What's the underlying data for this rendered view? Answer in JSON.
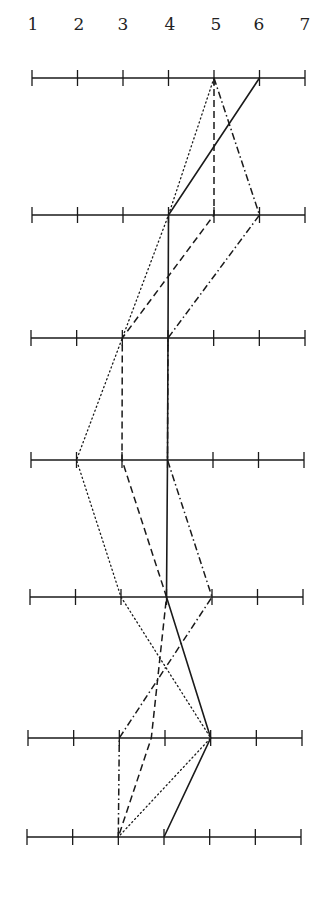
{
  "chart_data": {
    "type": "line",
    "title": "",
    "subtitle": "",
    "xlabel": "",
    "ylabel": "",
    "orientation": "parallel horizontal scales (profile plot)",
    "scale": {
      "ticks": [
        1,
        2,
        3,
        4,
        5,
        6,
        7
      ],
      "tick_labels": [
        "1",
        "2",
        "3",
        "4",
        "5",
        "6",
        "7"
      ],
      "range": [
        1,
        7
      ]
    },
    "items": [
      "item-1",
      "item-2",
      "item-3",
      "item-4",
      "item-5",
      "item-6",
      "item-7"
    ],
    "grid": false,
    "legend": null,
    "series": [
      {
        "name": "solid",
        "style": "solid",
        "values": [
          6,
          4,
          4,
          4,
          4,
          5,
          4
        ]
      },
      {
        "name": "dotted",
        "style": "dotted",
        "values": [
          5,
          4,
          3,
          2,
          3,
          5,
          3
        ]
      },
      {
        "name": "dashed",
        "style": "dashed",
        "values": [
          5,
          5,
          3,
          3,
          4,
          3.7,
          3
        ]
      },
      {
        "name": "dash-dot",
        "style": "dash-dot",
        "values": [
          5,
          6,
          4,
          4,
          5,
          3,
          3
        ]
      }
    ]
  },
  "layout": {
    "rows_y": [
      78,
      215,
      338,
      460,
      597,
      738,
      837
    ],
    "rows_x_start": [
      32,
      32,
      31,
      31,
      30,
      28,
      27
    ],
    "rows_x_end": [
      305,
      305,
      305,
      304,
      303,
      302,
      301
    ],
    "label_y": 30,
    "label_x": [
      33,
      79,
      123,
      170,
      216,
      259,
      305
    ],
    "line_color": "#1a1a1a"
  }
}
